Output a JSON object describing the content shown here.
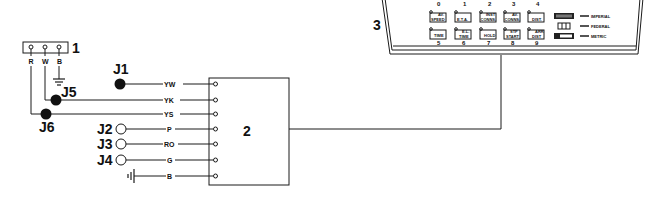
{
  "diagram": {
    "callouts": {
      "connector": "1",
      "module": "2",
      "display": "3"
    },
    "connector": {
      "terminals": [
        "R",
        "W",
        "B"
      ]
    },
    "jacks": {
      "j1": "J1",
      "j2": "J2",
      "j3": "J3",
      "j4": "J4",
      "j5": "J5",
      "j6": "J6"
    },
    "wires": [
      {
        "label": "YW"
      },
      {
        "label": "YK"
      },
      {
        "label": "YS"
      },
      {
        "label": "P"
      },
      {
        "label": "RO"
      },
      {
        "label": "G"
      },
      {
        "label": "B"
      }
    ],
    "display_panel": {
      "top_numbers": [
        "0",
        "1",
        "2",
        "3",
        "4"
      ],
      "bottom_numbers": [
        "5",
        "6",
        "7",
        "8",
        "9"
      ],
      "top_buttons": [
        {
          "line1": "AV.",
          "line2": "SPEED"
        },
        {
          "line1": "",
          "line2": "E.T.A."
        },
        {
          "line1": "INST",
          "line2": "CONNS."
        },
        {
          "line1": "AV.",
          "line2": "CONNS."
        },
        {
          "line1": "",
          "line2": "DIST."
        }
      ],
      "bottom_buttons": [
        {
          "line1": "",
          "line2": "TIME"
        },
        {
          "line1": "E.L.",
          "line2": "TIME"
        },
        {
          "line1": "",
          "line2": "HOLD"
        },
        {
          "line1": "STP",
          "line2": "START"
        },
        {
          "line1": "ARR",
          "line2": "DIST"
        }
      ],
      "mode_switch": [
        {
          "label": "IMPERIAL"
        },
        {
          "label": "FEDERAL"
        },
        {
          "label": "METRIC"
        }
      ]
    }
  }
}
